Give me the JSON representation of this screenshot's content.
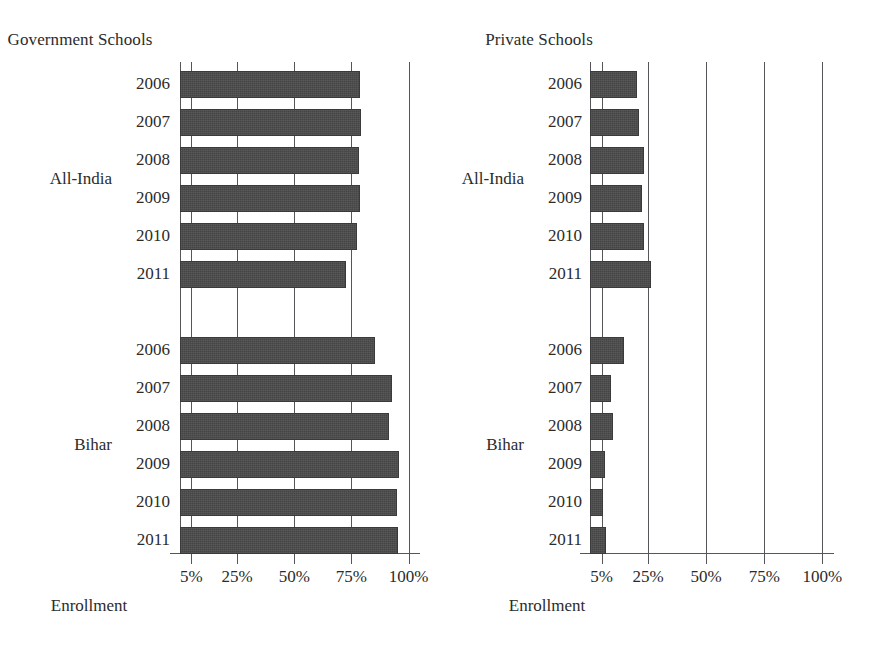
{
  "figure": {
    "background": "#ffffff",
    "bar_color": "#454545",
    "axis_color": "#55565a",
    "text_color": "#2b2b2b"
  },
  "chart_data": {
    "type": "bar",
    "orientation": "horizontal",
    "title": "",
    "panels": [
      {
        "title": "Government Schools",
        "xlabel": "Enrollment",
        "ylabel": "",
        "xlim": [
          0,
          105
        ],
        "xticks": [
          5,
          25,
          50,
          75,
          100
        ],
        "xticklabels": [
          "5%",
          "25%",
          "50%",
          "75%",
          "100%"
        ],
        "grid": true,
        "groups": [
          {
            "label": "All-India",
            "categories": [
              "2006",
              "2007",
              "2008",
              "2009",
              "2010",
              "2011"
            ],
            "values": [
              78.6,
              79.4,
              78.1,
              78.6,
              77.3,
              72.7
            ]
          },
          {
            "label": "Bihar",
            "categories": [
              "2006",
              "2007",
              "2008",
              "2009",
              "2010",
              "2011"
            ],
            "values": [
              85.3,
              92.7,
              91.4,
              95.7,
              94.8,
              95.2
            ]
          }
        ]
      },
      {
        "title": "Private Schools",
        "xlabel": "Enrollment",
        "ylabel": "",
        "xlim": [
          0,
          105
        ],
        "xticks": [
          5,
          25,
          50,
          75,
          100
        ],
        "xticklabels": [
          "5%",
          "25%",
          "50%",
          "75%",
          "100%"
        ],
        "grid": true,
        "groups": [
          {
            "label": "All-India",
            "categories": [
              "2006",
              "2007",
              "2008",
              "2009",
              "2010",
              "2011"
            ],
            "values": [
              20.3,
              21.1,
              23.3,
              22.4,
              23.3,
              26.4
            ]
          },
          {
            "label": "Bihar",
            "categories": [
              "2006",
              "2007",
              "2008",
              "2009",
              "2010",
              "2011"
            ],
            "values": [
              14.6,
              8.9,
              9.8,
              6.3,
              5.4,
              6.7
            ]
          }
        ]
      }
    ]
  }
}
